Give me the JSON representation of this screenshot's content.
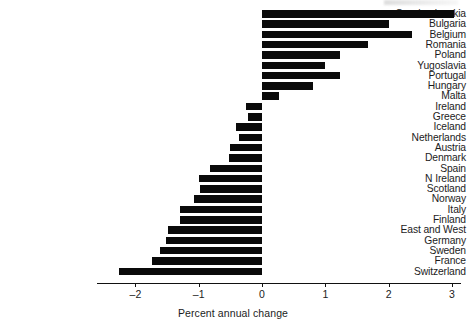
{
  "chart_data": {
    "type": "bar",
    "orientation": "horizontal",
    "title": "",
    "xlabel": "Percent  annual change",
    "ylabel": "",
    "xlim": [
      -2.6,
      3.15
    ],
    "grid": false,
    "legend": null,
    "xticks": [
      -2,
      -1,
      0,
      1,
      2,
      3
    ],
    "xtick_labels": [
      "–2",
      "–1",
      "0",
      "1",
      "2",
      "3"
    ],
    "categories": [
      "Czechoslovakia",
      "Bulgaria",
      "Belgium",
      "Romania",
      "Poland",
      "Yugoslavia",
      "Portugal",
      "Hungary",
      "Malta",
      "Ireland",
      "Greece",
      "Iceland",
      "Netherlands",
      "Austria",
      "Denmark",
      "Spain",
      "N Ireland",
      "Scotland",
      "Norway",
      "Italy",
      "Finland",
      "East and West",
      "Germany",
      "Sweden",
      "France",
      "Switzerland"
    ],
    "values": [
      3.03,
      2.0,
      2.37,
      1.67,
      1.23,
      1.0,
      1.23,
      0.81,
      0.27,
      -0.25,
      -0.22,
      -0.41,
      -0.36,
      -0.51,
      -0.52,
      -0.82,
      -1.0,
      -0.98,
      -1.07,
      -1.29,
      -1.29,
      -1.48,
      -1.52,
      -1.61,
      -1.74,
      -2.26
    ],
    "bar_color": "#0a0a0a"
  }
}
